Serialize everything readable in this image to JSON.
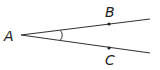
{
  "diagram": {
    "type": "angle",
    "vertex": {
      "label": "A",
      "x": 21,
      "y": 35,
      "label_x": 4,
      "label_y": 41
    },
    "rays": [
      {
        "name": "ray-AB",
        "x2": 150,
        "y2": 19
      },
      {
        "name": "ray-AC",
        "x2": 150,
        "y2": 53
      }
    ],
    "points": [
      {
        "label": "B",
        "x": 109,
        "y": 24,
        "label_x": 105,
        "label_y": 17
      },
      {
        "label": "C",
        "x": 109,
        "y": 48,
        "label_x": 105,
        "label_y": 65
      }
    ],
    "angle_mark": "arc",
    "colors": {
      "stroke": "#333333",
      "text": "#222222"
    }
  }
}
